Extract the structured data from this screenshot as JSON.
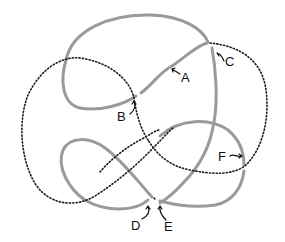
{
  "diagram": {
    "type": "knot-diagram",
    "colors": {
      "solid_strand": "#9a9a9a",
      "dotted_strand": "#1a1a1a",
      "background": "#ffffff"
    },
    "labels": [
      {
        "id": "A",
        "text": "A"
      },
      {
        "id": "B",
        "text": "B"
      },
      {
        "id": "C",
        "text": "C"
      },
      {
        "id": "D",
        "text": "D"
      },
      {
        "id": "E",
        "text": "E"
      },
      {
        "id": "F",
        "text": "F"
      }
    ]
  }
}
